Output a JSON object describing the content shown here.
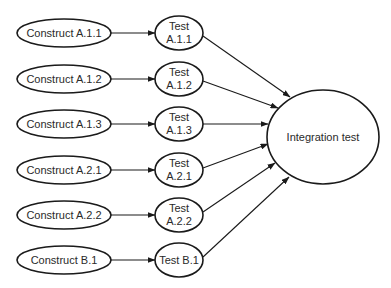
{
  "diagram": {
    "type": "flow",
    "constructs": [
      {
        "id": "c1",
        "label": "Construct A.1.1"
      },
      {
        "id": "c2",
        "label": "Construct A.1.2"
      },
      {
        "id": "c3",
        "label": "Construct A.1.3"
      },
      {
        "id": "c4",
        "label": "Construct A.2.1"
      },
      {
        "id": "c5",
        "label": "Construct A.2.2"
      },
      {
        "id": "c6",
        "label": "Construct B.1"
      }
    ],
    "tests": [
      {
        "id": "t1",
        "line1": "Test",
        "line2": "A.1.1"
      },
      {
        "id": "t2",
        "line1": "Test",
        "line2": "A.1.2"
      },
      {
        "id": "t3",
        "line1": "Test",
        "line2": "A.1.3"
      },
      {
        "id": "t4",
        "line1": "Test",
        "line2": "A.2.1"
      },
      {
        "id": "t5",
        "line1": "Test",
        "line2": "A.2.2"
      },
      {
        "id": "t6",
        "line1": "Test B.1",
        "line2": ""
      }
    ],
    "integration": {
      "id": "int",
      "label": "Integration test"
    },
    "edges": [
      [
        "c1",
        "t1"
      ],
      [
        "c2",
        "t2"
      ],
      [
        "c3",
        "t3"
      ],
      [
        "c4",
        "t4"
      ],
      [
        "c5",
        "t5"
      ],
      [
        "c6",
        "t6"
      ],
      [
        "t1",
        "int"
      ],
      [
        "t2",
        "int"
      ],
      [
        "t3",
        "int"
      ],
      [
        "t4",
        "int"
      ],
      [
        "t5",
        "int"
      ],
      [
        "t6",
        "int"
      ]
    ]
  }
}
